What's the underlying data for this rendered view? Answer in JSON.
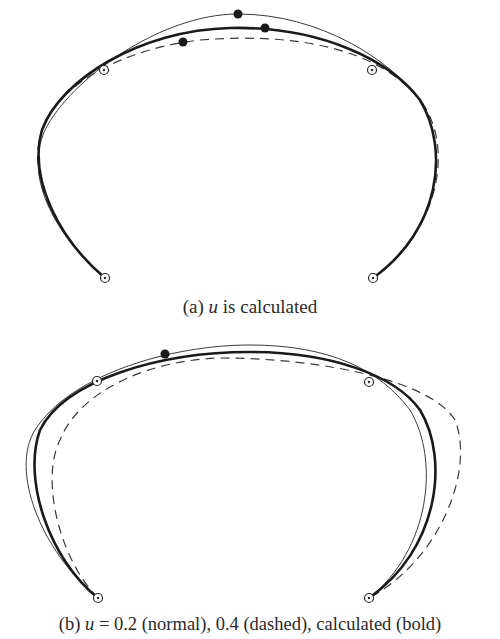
{
  "figure": {
    "panel_a": {
      "caption_prefix": "(a) ",
      "caption_var": "u",
      "caption_suffix": " is calculated",
      "curves": [
        {
          "name": "normal",
          "style": "thin",
          "path": "M105,278 C60,240 22,180 45,130 C70,80 160,14 238,14 C320,14 390,60 420,100 C450,150 440,230 373,278"
        },
        {
          "name": "dashed",
          "style": "dashed",
          "path": "M105,278 C60,240 25,180 42,130 C60,80 130,48 200,40 C300,32 380,50 420,100 C455,145 440,230 373,278"
        },
        {
          "name": "bold",
          "style": "bold",
          "path": "M105,278 C60,240 28,180 42,130 C60,80 140,30 230,28 C320,26 390,60 420,100 C450,150 440,230 373,278"
        }
      ],
      "open_points": [
        [
          104,
          70
        ],
        [
          372,
          70
        ],
        [
          105,
          278
        ],
        [
          373,
          278
        ]
      ],
      "filled_points": [
        [
          238,
          14
        ],
        [
          265,
          28
        ],
        [
          183,
          42
        ]
      ]
    },
    "panel_b": {
      "caption_prefix": "(b) ",
      "caption_var": "u",
      "caption_suffix": " = 0.2 (normal), 0.4 (dashed), calculated (bold)",
      "curves": [
        {
          "name": "normal",
          "style": "thin",
          "path": "M98,598 C40,550 10,470 35,430 C70,375 170,345 250,345 C330,345 380,370 410,410 C440,460 430,550 369,598"
        },
        {
          "name": "dashed",
          "style": "dashed",
          "path": "M98,598 C60,560 40,480 60,440 C80,390 150,360 220,358 C320,358 430,380 455,420 C475,470 440,560 369,598"
        },
        {
          "name": "bold",
          "style": "bold",
          "path": "M98,598 C50,560 22,480 40,430 C65,380 160,352 250,352 C330,352 395,375 420,410 C450,460 438,550 369,598"
        }
      ],
      "open_points": [
        [
          97,
          381
        ],
        [
          369,
          382
        ],
        [
          98,
          598
        ],
        [
          369,
          598
        ]
      ],
      "filled_points": [
        [
          165,
          354
        ]
      ]
    }
  }
}
